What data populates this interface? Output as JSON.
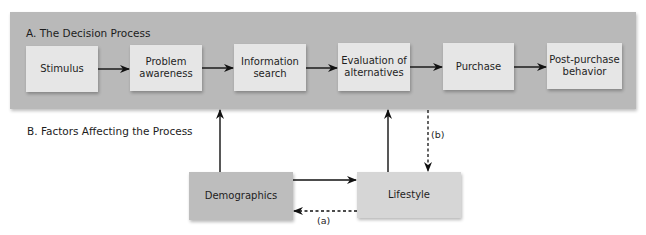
{
  "diagram": {
    "section_a": {
      "title": "A. The Decision Process",
      "steps": [
        {
          "label": "Stimulus"
        },
        {
          "label": "Problem awareness"
        },
        {
          "label": "Information search"
        },
        {
          "label": "Evaluation of alternatives"
        },
        {
          "label": "Purchase"
        },
        {
          "label": "Post-purchase behavior"
        }
      ]
    },
    "section_b": {
      "title": "B. Factors Affecting the Process",
      "factors": [
        {
          "label": "Demographics"
        },
        {
          "label": "Lifestyle"
        }
      ]
    },
    "edge_labels": {
      "a": "(a)",
      "b": "(b)"
    },
    "edges": [
      {
        "from": "Stimulus",
        "to": "Problem awareness",
        "style": "solid"
      },
      {
        "from": "Problem awareness",
        "to": "Information search",
        "style": "solid"
      },
      {
        "from": "Information search",
        "to": "Evaluation of alternatives",
        "style": "solid"
      },
      {
        "from": "Evaluation of alternatives",
        "to": "Purchase",
        "style": "solid"
      },
      {
        "from": "Purchase",
        "to": "Post-purchase behavior",
        "style": "solid"
      },
      {
        "from": "Demographics",
        "to": "Decision Process (Problem awareness → Information search)",
        "style": "solid"
      },
      {
        "from": "Lifestyle",
        "to": "Decision Process (Information search → Evaluation of alternatives)",
        "style": "solid"
      },
      {
        "from": "Demographics",
        "to": "Lifestyle",
        "style": "solid"
      },
      {
        "from": "Lifestyle",
        "to": "Demographics",
        "style": "dashed",
        "label": "(a)"
      },
      {
        "from": "Decision Process (Evaluation of alternatives → Purchase)",
        "to": "Lifestyle",
        "style": "dashed",
        "label": "(b)"
      }
    ],
    "colors": {
      "band": "#b9b9b9",
      "step_box": "#e6e6e6",
      "demographics_box": "#bdbdbd",
      "lifestyle_box": "#d6d6d6",
      "arrow": "#111111"
    }
  }
}
